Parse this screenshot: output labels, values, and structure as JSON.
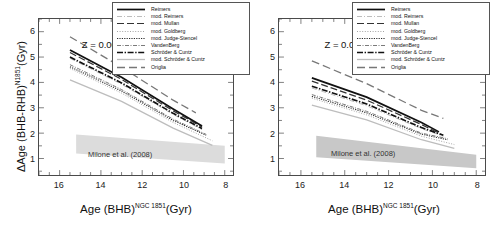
{
  "figure": {
    "panels": [
      "left",
      "right"
    ],
    "xlabel_main": "Age (BHB)",
    "xlabel_sup": "NGC 1851",
    "xlabel_unit": "(Gyr)",
    "ylabel_main": "ΔAge (BHB-RHB)",
    "ylabel_sup": "N1851",
    "ylabel_unit": "(Gyr)",
    "band_label": "Milone et al. (2008)",
    "colors": {
      "axis": "#4a4a4a",
      "curve_dark": "#1a1a1a",
      "curve_mid": "#555555",
      "curve_light": "#9a9a9a",
      "band_left": "#dcdcdc",
      "band_right": "#c8c8c8",
      "legend_border": "#555555"
    }
  },
  "legend": {
    "entries": [
      {
        "label": "Reimers",
        "style": "solid-thick",
        "color": "#111111"
      },
      {
        "label": "mod. Reimers",
        "style": "dash-dot-light",
        "color": "#b5b5b5"
      },
      {
        "label": "mod. Mullan",
        "style": "long-dash",
        "color": "#333333"
      },
      {
        "label": "mod. Goldberg",
        "style": "fine-dot",
        "color": "#8d8d8d"
      },
      {
        "label": "mod. Judge-Stencel",
        "style": "dense-dot",
        "color": "#2b2b2b"
      },
      {
        "label": "VandenBerg",
        "style": "dash-dot",
        "color": "#6b6b6b"
      },
      {
        "label": "Schröder & Cuntz",
        "style": "thick-dashdot",
        "color": "#111111"
      },
      {
        "label": "mod. Schröder & Cuntz",
        "style": "solid-light",
        "color": "#bdbdbd"
      },
      {
        "label": "Origlia",
        "style": "long-dash-mid",
        "color": "#777777"
      }
    ]
  },
  "panel_left": {
    "annotation": "Z = 0.001"
  },
  "panel_right": {
    "annotation": "Z = 0.002"
  },
  "chart_data": [
    {
      "type": "line",
      "panel": "left",
      "title": "",
      "annotation": "Z = 0.001",
      "xlabel": "Age (BHB)^NGC 1851 (Gyr)",
      "ylabel": "ΔAge (BHB-RHB)^N1851 (Gyr)",
      "xlim": [
        17.0,
        7.6
      ],
      "ylim": [
        0.35,
        6.5
      ],
      "x_ticks": [
        16,
        14,
        12,
        10,
        8
      ],
      "y_ticks": [
        1,
        2,
        3,
        4,
        5,
        6
      ],
      "x_reversed": true,
      "grid": false,
      "legend_position": "upper-right",
      "series": [
        {
          "name": "Origlia",
          "x": [
            15.5,
            13.0,
            10.5,
            9.4
          ],
          "values": [
            5.8,
            4.6,
            3.3,
            2.8
          ]
        },
        {
          "name": "Reimers",
          "x": [
            15.5,
            13.0,
            10.5,
            9.1
          ],
          "values": [
            5.28,
            4.2,
            2.95,
            2.28
          ]
        },
        {
          "name": "mod. Mullan",
          "x": [
            15.5,
            13.0,
            10.5,
            9.1
          ],
          "values": [
            5.18,
            4.12,
            2.88,
            2.24
          ]
        },
        {
          "name": "Schröder & Cuntz",
          "x": [
            15.5,
            13.0,
            10.5,
            9.1
          ],
          "values": [
            5.0,
            3.98,
            2.78,
            2.18
          ]
        },
        {
          "name": "mod. Reimers",
          "x": [
            15.5,
            13.0,
            10.5,
            9.1
          ],
          "values": [
            4.95,
            3.93,
            2.74,
            2.14
          ]
        },
        {
          "name": "VandenBerg",
          "x": [
            15.5,
            13.0,
            10.5,
            8.9
          ],
          "values": [
            4.7,
            3.72,
            2.55,
            1.95
          ]
        },
        {
          "name": "mod. Judge-Stencel",
          "x": [
            15.5,
            13.0,
            10.5,
            8.9
          ],
          "values": [
            4.62,
            3.66,
            2.5,
            1.92
          ]
        },
        {
          "name": "mod. Goldberg",
          "x": [
            15.5,
            13.0,
            10.5,
            8.6
          ],
          "values": [
            4.55,
            3.58,
            2.42,
            1.7
          ]
        },
        {
          "name": "mod. Schröder & Cuntz",
          "x": [
            15.5,
            13.0,
            10.5,
            8.6
          ],
          "values": [
            4.1,
            3.25,
            2.2,
            1.52
          ]
        }
      ],
      "band": {
        "label": "Milone et al. (2008)",
        "x": [
          15.2,
          8.0
        ],
        "upper": [
          1.95,
          1.5
        ],
        "lower": [
          1.2,
          0.8
        ]
      }
    },
    {
      "type": "line",
      "panel": "right",
      "title": "",
      "annotation": "Z = 0.002",
      "xlabel": "Age (BHB)^NGC 1851 (Gyr)",
      "ylabel": "ΔAge (BHB-RHB)^N1851 (Gyr)",
      "xlim": [
        17.0,
        7.6
      ],
      "ylim": [
        0.35,
        6.5
      ],
      "x_ticks": [
        16,
        14,
        12,
        10,
        8
      ],
      "y_ticks": [
        1,
        2,
        3,
        4,
        5,
        6
      ],
      "x_reversed": true,
      "grid": false,
      "legend_position": "upper-right",
      "series": [
        {
          "name": "Origlia",
          "x": [
            15.5,
            13.0,
            10.5,
            9.5
          ],
          "values": [
            4.85,
            3.95,
            2.9,
            2.58
          ]
        },
        {
          "name": "Reimers",
          "x": [
            15.5,
            13.0,
            10.5,
            9.7
          ],
          "values": [
            4.18,
            3.42,
            2.42,
            2.05
          ]
        },
        {
          "name": "mod. Mullan",
          "x": [
            15.5,
            13.0,
            10.5,
            9.7
          ],
          "values": [
            4.05,
            3.3,
            2.34,
            2.0
          ]
        },
        {
          "name": "Schröder & Cuntz",
          "x": [
            15.5,
            13.0,
            10.5,
            9.5
          ],
          "values": [
            3.85,
            3.15,
            2.22,
            1.92
          ]
        },
        {
          "name": "mod. Reimers",
          "x": [
            15.5,
            13.0,
            10.5,
            9.5
          ],
          "values": [
            3.78,
            3.08,
            2.18,
            1.88
          ]
        },
        {
          "name": "VandenBerg",
          "x": [
            15.5,
            13.0,
            10.5,
            9.3
          ],
          "values": [
            3.52,
            2.86,
            2.0,
            1.78
          ]
        },
        {
          "name": "mod. Judge-Stencel",
          "x": [
            15.5,
            13.0,
            10.5,
            9.3
          ],
          "values": [
            3.45,
            2.8,
            1.96,
            1.74
          ]
        },
        {
          "name": "mod. Goldberg",
          "x": [
            15.5,
            13.0,
            10.5,
            9.0
          ],
          "values": [
            3.38,
            2.72,
            1.88,
            1.55
          ]
        },
        {
          "name": "mod. Schröder & Cuntz",
          "x": [
            15.5,
            13.0,
            10.5,
            9.0
          ],
          "values": [
            3.1,
            2.52,
            1.74,
            1.4
          ]
        }
      ],
      "band": {
        "label": "Milone et al. (2008)",
        "x": [
          15.3,
          8.0
        ],
        "upper": [
          1.9,
          1.15
        ],
        "lower": [
          1.05,
          0.62
        ]
      }
    }
  ]
}
